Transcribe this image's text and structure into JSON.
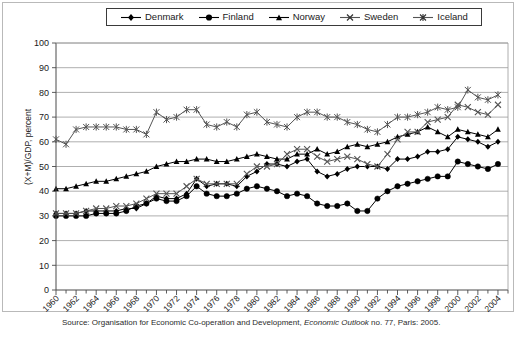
{
  "figure": {
    "ylabel": "(X+M)/GDP, percent",
    "source_prefix": "Source: Organisation for Economic Co-operation and Development, ",
    "source_italic": "Economic Outlook",
    "source_suffix": " no. 77, Paris: 2005."
  },
  "legend": {
    "position": "top-center",
    "items": [
      {
        "label": "Denmark",
        "marker": "diamond",
        "color": "#000000"
      },
      {
        "label": "Finland",
        "marker": "circle",
        "color": "#000000"
      },
      {
        "label": "Norway",
        "marker": "triangle",
        "color": "#000000"
      },
      {
        "label": "Sweden",
        "marker": "x",
        "color": "#555555"
      },
      {
        "label": "Iceland",
        "marker": "asterisk",
        "color": "#555555"
      }
    ]
  },
  "chart_data": {
    "type": "line",
    "title": "",
    "xlabel": "",
    "ylabel": "(X+M)/GDP, percent",
    "xlim": [
      1960,
      2005
    ],
    "ylim": [
      0,
      100
    ],
    "ytick_step": 10,
    "yticks": [
      0,
      10,
      20,
      30,
      40,
      50,
      60,
      70,
      80,
      90,
      100
    ],
    "xticks": [
      1960,
      1962,
      1964,
      1966,
      1968,
      1970,
      1972,
      1974,
      1976,
      1978,
      1980,
      1982,
      1984,
      1986,
      1988,
      1990,
      1992,
      1994,
      1996,
      1998,
      2000,
      2002,
      2004
    ],
    "xtick_minor_step": 1,
    "grid": "horizontal",
    "legend_position": "top-center",
    "x": [
      1960,
      1961,
      1962,
      1963,
      1964,
      1965,
      1966,
      1967,
      1968,
      1969,
      1970,
      1971,
      1972,
      1973,
      1974,
      1975,
      1976,
      1977,
      1978,
      1979,
      1980,
      1981,
      1982,
      1983,
      1984,
      1985,
      1986,
      1987,
      1988,
      1989,
      1990,
      1991,
      1992,
      1993,
      1994,
      1995,
      1996,
      1997,
      1998,
      1999,
      2000,
      2001,
      2002,
      2003,
      2004
    ],
    "series": [
      {
        "name": "Denmark",
        "marker": "diamond",
        "values": [
          31,
          31,
          31,
          32,
          32,
          32,
          32,
          33,
          33,
          35,
          38,
          37,
          37,
          39,
          45,
          42,
          43,
          43,
          42,
          46,
          48,
          51,
          51,
          50,
          52,
          53,
          48,
          46,
          47,
          49,
          50,
          50,
          50,
          49,
          53,
          53,
          54,
          56,
          56,
          57,
          62,
          61,
          60,
          58,
          60
        ]
      },
      {
        "name": "Finland",
        "marker": "circle",
        "values": [
          30,
          30,
          30,
          30,
          31,
          31,
          31,
          32,
          34,
          35,
          37,
          36,
          36,
          38,
          42,
          39,
          38,
          38,
          39,
          41,
          42,
          41,
          40,
          38,
          39,
          38,
          35,
          34,
          34,
          35,
          32,
          32,
          37,
          40,
          42,
          43,
          44,
          45,
          46,
          46,
          52,
          51,
          50,
          49,
          51
        ]
      },
      {
        "name": "Norway",
        "marker": "triangle",
        "values": [
          41,
          41,
          42,
          43,
          44,
          44,
          45,
          46,
          47,
          48,
          50,
          51,
          52,
          52,
          53,
          53,
          52,
          52,
          53,
          54,
          55,
          54,
          53,
          53,
          55,
          55,
          57,
          55,
          56,
          58,
          59,
          58,
          59,
          60,
          62,
          63,
          64,
          66,
          64,
          62,
          65,
          64,
          63,
          62,
          65
        ]
      },
      {
        "name": "Sweden",
        "marker": "x",
        "values": [
          31,
          31,
          31,
          32,
          33,
          33,
          34,
          34,
          35,
          37,
          39,
          39,
          39,
          42,
          45,
          43,
          43,
          43,
          43,
          47,
          50,
          50,
          51,
          55,
          57,
          57,
          54,
          52,
          53,
          54,
          53,
          51,
          50,
          55,
          61,
          64,
          64,
          68,
          69,
          70,
          75,
          74,
          72,
          71,
          75
        ]
      },
      {
        "name": "Iceland",
        "marker": "asterisk",
        "values": [
          61,
          59,
          65,
          66,
          66,
          66,
          66,
          65,
          65,
          63,
          72,
          69,
          70,
          73,
          73,
          67,
          66,
          68,
          66,
          71,
          72,
          68,
          67,
          66,
          70,
          72,
          72,
          70,
          70,
          68,
          67,
          65,
          64,
          67,
          70,
          70,
          71,
          72,
          74,
          73,
          74,
          81,
          78,
          77,
          79
        ]
      }
    ]
  }
}
